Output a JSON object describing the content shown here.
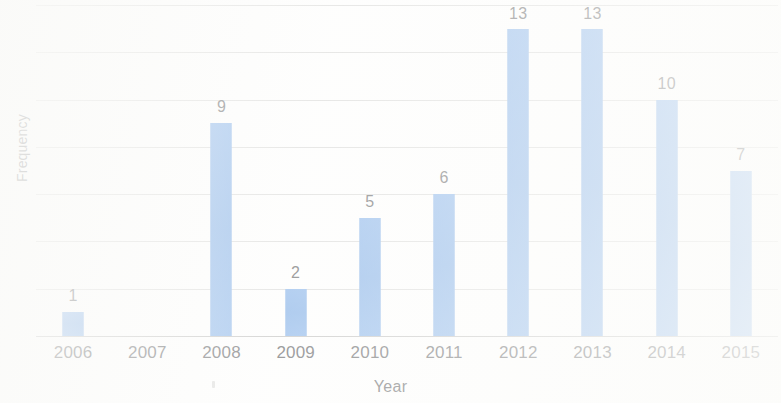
{
  "chart_data": {
    "type": "bar",
    "title": "",
    "xlabel": "Year",
    "ylabel": "Frequency",
    "categories": [
      "2006",
      "2007",
      "2008",
      "2009",
      "2010",
      "2011",
      "2012",
      "2013",
      "2014",
      "2015"
    ],
    "values": [
      1,
      0,
      9,
      2,
      5,
      6,
      13,
      13,
      10,
      7
    ],
    "data_labels": [
      "1",
      "",
      "9",
      "2",
      "5",
      "6",
      "13",
      "13",
      "10",
      "7"
    ],
    "ylim": [
      0,
      14
    ],
    "y_gridline_values": [
      0,
      2,
      4,
      6,
      8,
      10,
      12,
      14
    ],
    "y_tick_labels_visible": false,
    "grid": true,
    "legend": false,
    "legend_position": "none",
    "bar_color": "#80AEE6",
    "label_color": "#5d5e60",
    "gridline_color": "#c9c9c7",
    "background_color": "#fdfdfc"
  },
  "axes": {
    "x_title": "Year",
    "y_title": "Frequency"
  }
}
